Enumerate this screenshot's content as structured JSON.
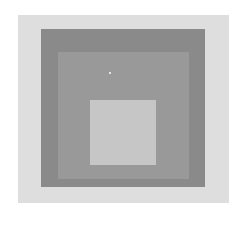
{
  "artwork": {
    "description": "Nested squares (Homage to the Square style), grayscale",
    "colors": {
      "background": "#ffffff",
      "outer_field": "#dedede",
      "dark_square": "#8a8a8a",
      "middle_square": "#999999",
      "inner_square": "#c6c6c6",
      "highlight_spot": "#ffffff"
    }
  }
}
